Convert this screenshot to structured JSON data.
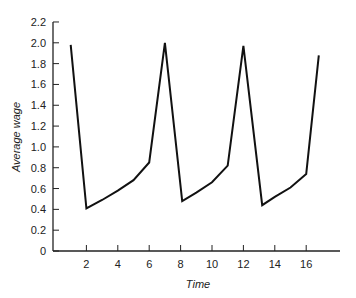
{
  "chart_data": {
    "type": "line",
    "title": "",
    "xlabel": "Time",
    "ylabel": "Average wage",
    "xlim": [
      0,
      18
    ],
    "ylim": [
      0,
      2.2
    ],
    "grid": false,
    "legend": null,
    "x_ticks": [
      2,
      4,
      6,
      8,
      10,
      12,
      14,
      16
    ],
    "y_ticks": [
      "0",
      "0.2",
      "0.4",
      "0.6",
      "0.8",
      "1.0",
      "1.2",
      "1.4",
      "1.6",
      "1.8",
      "2.0",
      "2.2"
    ],
    "series": [
      {
        "name": "Average wage",
        "x": [
          1.0,
          2.0,
          3.0,
          4.0,
          5.0,
          6.0,
          7.0,
          8.1,
          9.0,
          10.0,
          11.0,
          12.0,
          13.2,
          14.0,
          15.0,
          16.0,
          16.8
        ],
        "y": [
          1.98,
          0.41,
          0.49,
          0.58,
          0.68,
          0.85,
          2.0,
          0.48,
          0.56,
          0.66,
          0.82,
          1.97,
          0.44,
          0.52,
          0.61,
          0.74,
          1.88
        ]
      }
    ]
  }
}
